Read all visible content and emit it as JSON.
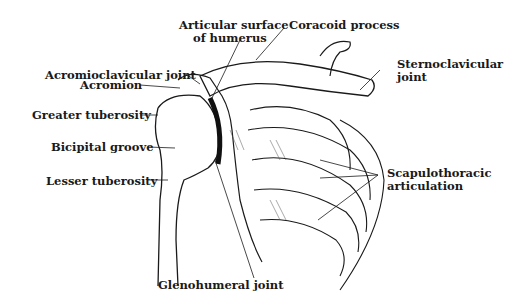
{
  "diagram": {
    "labels": {
      "articular_surface_1": "Articular surface",
      "articular_surface_2": "of humerus",
      "coracoid": "Coracoid process",
      "acromioclavicular": "Acromioclavicular joint",
      "acromion": "Acromion",
      "sternoclavicular_1": "Sternoclavicular",
      "sternoclavicular_2": "joint",
      "greater_tuberosity": "Greater tuberosity",
      "bicipital_groove": "Bicipital groove",
      "lesser_tuberosity": "Lesser tuberosity",
      "scapulothoracic_1": "Scapulothoracic",
      "scapulothoracic_2": "articulation",
      "glenohumeral": "Glenohumeral joint"
    }
  }
}
